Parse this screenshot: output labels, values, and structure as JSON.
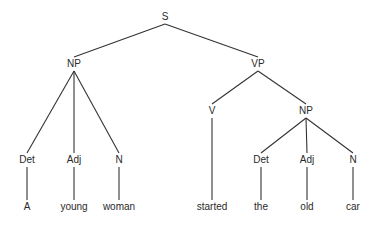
{
  "diagram": {
    "type": "syntax-tree",
    "nodes": {
      "S": {
        "label": "S",
        "x": 165,
        "y": 17
      },
      "NP1": {
        "label": "NP",
        "x": 74,
        "y": 64
      },
      "VP": {
        "label": "VP",
        "x": 258,
        "y": 64
      },
      "Det1": {
        "label": "Det",
        "x": 27,
        "y": 160
      },
      "Adj1": {
        "label": "Adj",
        "x": 74,
        "y": 160
      },
      "N1": {
        "label": "N",
        "x": 119,
        "y": 160
      },
      "V": {
        "label": "V",
        "x": 212,
        "y": 111
      },
      "NP2": {
        "label": "NP",
        "x": 306,
        "y": 111
      },
      "Det2": {
        "label": "Det",
        "x": 261,
        "y": 160
      },
      "Adj2": {
        "label": "Adj",
        "x": 307,
        "y": 160
      },
      "N2": {
        "label": "N",
        "x": 353,
        "y": 160
      },
      "w1": {
        "label": "A",
        "x": 27,
        "y": 207
      },
      "w2": {
        "label": "young",
        "x": 74,
        "y": 207
      },
      "w3": {
        "label": "woman",
        "x": 119,
        "y": 207
      },
      "w4": {
        "label": "started",
        "x": 212,
        "y": 207
      },
      "w5": {
        "label": "the",
        "x": 261,
        "y": 207
      },
      "w6": {
        "label": "old",
        "x": 307,
        "y": 207
      },
      "w7": {
        "label": "car",
        "x": 353,
        "y": 207
      }
    },
    "edges": [
      [
        "S",
        "NP1"
      ],
      [
        "S",
        "VP"
      ],
      [
        "NP1",
        "Det1"
      ],
      [
        "NP1",
        "Adj1"
      ],
      [
        "NP1",
        "N1"
      ],
      [
        "VP",
        "V"
      ],
      [
        "VP",
        "NP2"
      ],
      [
        "NP2",
        "Det2"
      ],
      [
        "NP2",
        "Adj2"
      ],
      [
        "NP2",
        "N2"
      ],
      [
        "Det1",
        "w1"
      ],
      [
        "Adj1",
        "w2"
      ],
      [
        "N1",
        "w3"
      ],
      [
        "V",
        "w4"
      ],
      [
        "Det2",
        "w5"
      ],
      [
        "Adj2",
        "w6"
      ],
      [
        "N2",
        "w7"
      ]
    ],
    "line_color": "#333333"
  }
}
